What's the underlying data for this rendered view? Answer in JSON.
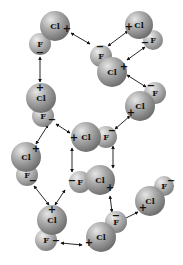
{
  "diagram": {
    "type": "dipole-dipole interactions",
    "molecules": [
      {
        "id": "m1",
        "cl": {
          "x": 55,
          "y": 26,
          "r": 15,
          "label": "Cl",
          "charge": "+",
          "cx": 67,
          "cy": 29
        },
        "f": {
          "x": 40,
          "y": 44,
          "r": 11,
          "label": "F",
          "charge": "−",
          "cx": 40,
          "cy": 53
        }
      },
      {
        "id": "m2",
        "cl": {
          "x": 139,
          "y": 25,
          "r": 14,
          "label": "Cl",
          "charge": "+",
          "cx": 129,
          "cy": 27
        },
        "f": {
          "x": 153,
          "y": 40,
          "r": 10,
          "label": "F",
          "charge": "−",
          "cx": 145,
          "cy": 43
        }
      },
      {
        "id": "m3",
        "f": {
          "x": 101,
          "y": 56,
          "r": 11,
          "label": "F",
          "charge": "−",
          "cx": 100,
          "cy": 47
        },
        "cl": {
          "x": 112,
          "y": 72,
          "r": 15,
          "label": "Cl",
          "charge": "+",
          "cx": 124,
          "cy": 67
        }
      },
      {
        "id": "m4",
        "f": {
          "x": 155,
          "y": 93,
          "r": 11,
          "label": "F",
          "charge": "−",
          "cx": 151,
          "cy": 86
        },
        "cl": {
          "x": 140,
          "y": 106,
          "r": 15,
          "label": "Cl",
          "charge": "+",
          "cx": 131,
          "cy": 113
        }
      },
      {
        "id": "m5",
        "cl": {
          "x": 41,
          "y": 98,
          "r": 15,
          "label": "Cl",
          "charge": "+",
          "cx": 40,
          "cy": 88
        },
        "f": {
          "x": 43,
          "y": 116,
          "r": 11,
          "label": "F",
          "charge": "−",
          "cx": 52,
          "cy": 120
        }
      },
      {
        "id": "m6",
        "cl": {
          "x": 86,
          "y": 137,
          "r": 15,
          "label": "Cl",
          "charge": "+",
          "cx": 74,
          "cy": 138
        },
        "f": {
          "x": 106,
          "y": 137,
          "r": 11,
          "label": "F",
          "charge": "−",
          "cx": 112,
          "cy": 131
        }
      },
      {
        "id": "m7",
        "cl": {
          "x": 26,
          "y": 157,
          "r": 15,
          "label": "Cl",
          "charge": "+",
          "cx": 36,
          "cy": 149
        },
        "f": {
          "x": 27,
          "y": 175,
          "r": 11,
          "label": "F",
          "charge": "−",
          "cx": 33,
          "cy": 181
        }
      },
      {
        "id": "m8",
        "f": {
          "x": 80,
          "y": 182,
          "r": 11,
          "label": "F",
          "charge": "−",
          "cx": 72,
          "cy": 181
        },
        "cl": {
          "x": 100,
          "y": 180,
          "r": 15,
          "label": "Cl",
          "charge": "+",
          "cx": 110,
          "cy": 188
        }
      },
      {
        "id": "m9",
        "f": {
          "x": 164,
          "y": 186,
          "r": 10,
          "label": "F",
          "charge": "−",
          "cx": 171,
          "cy": 181
        },
        "cl": {
          "x": 150,
          "y": 201,
          "r": 15,
          "label": "Cl",
          "charge": "+",
          "cx": 143,
          "cy": 208
        }
      },
      {
        "id": "m10",
        "cl": {
          "x": 52,
          "y": 220,
          "r": 15,
          "label": "Cl",
          "charge": "+",
          "cx": 52,
          "cy": 210
        },
        "f": {
          "x": 46,
          "y": 240,
          "r": 11,
          "label": "F",
          "charge": "−",
          "cx": 56,
          "cy": 241
        }
      },
      {
        "id": "m11",
        "f": {
          "x": 116,
          "y": 222,
          "r": 11,
          "label": "F",
          "charge": "−",
          "cx": 116,
          "cy": 216
        },
        "cl": {
          "x": 101,
          "y": 237,
          "r": 15,
          "label": "Cl",
          "charge": "+",
          "cx": 89,
          "cy": 243
        }
      }
    ],
    "interactions": [
      {
        "from": [
          71,
          33
        ],
        "to": [
          90,
          44
        ]
      },
      {
        "from": [
          40,
          57
        ],
        "to": [
          40,
          82
        ]
      },
      {
        "from": [
          128,
          31
        ],
        "to": [
          108,
          46
        ]
      },
      {
        "from": [
          145,
          47
        ],
        "to": [
          127,
          60
        ]
      },
      {
        "from": [
          127,
          75
        ],
        "to": [
          146,
          87
        ]
      },
      {
        "from": [
          130,
          116
        ],
        "to": [
          115,
          129
        ]
      },
      {
        "from": [
          48,
          125
        ],
        "to": [
          36,
          144
        ]
      },
      {
        "from": [
          56,
          124
        ],
        "to": [
          70,
          133
        ]
      },
      {
        "from": [
          72,
          148
        ],
        "to": [
          72,
          172
        ]
      },
      {
        "from": [
          113,
          146
        ],
        "to": [
          113,
          168
        ]
      },
      {
        "from": [
          34,
          186
        ],
        "to": [
          49,
          205
        ]
      },
      {
        "from": [
          65,
          190
        ],
        "to": [
          55,
          205
        ]
      },
      {
        "from": [
          110,
          196
        ],
        "to": [
          112,
          212
        ]
      },
      {
        "from": [
          138,
          212
        ],
        "to": [
          122,
          220
        ]
      },
      {
        "from": [
          61,
          243
        ],
        "to": [
          82,
          245
        ]
      }
    ]
  }
}
